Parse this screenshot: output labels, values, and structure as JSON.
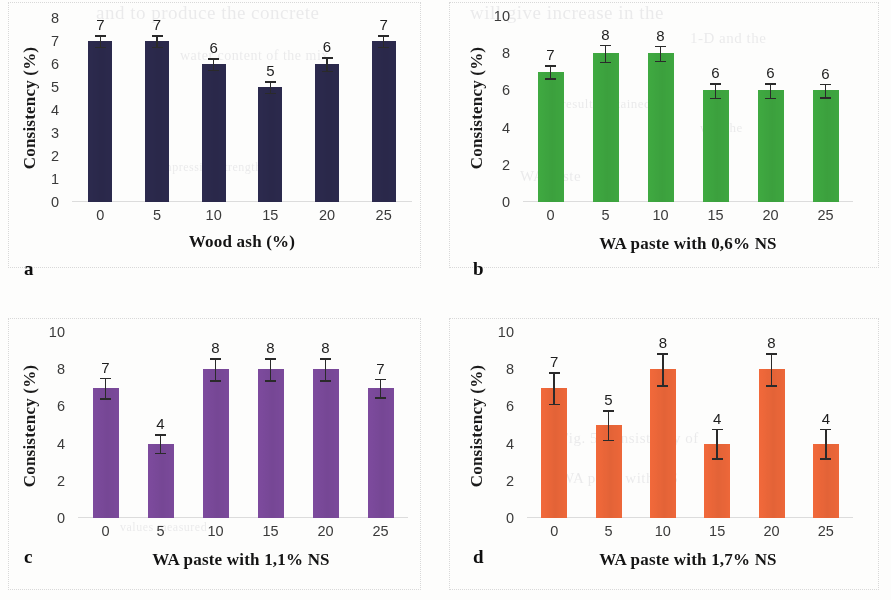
{
  "figure": {
    "background_bleed": [
      {
        "text": "and to  produce  the  concrete",
        "x": 96,
        "y": 2,
        "size": 19
      },
      {
        "text": "will give  increase  in  the",
        "x": 470,
        "y": 2,
        "size": 19
      },
      {
        "text": "1-D  and  the",
        "x": 690,
        "y": 30,
        "size": 15
      },
      {
        "text": "water  content  of  the  mix",
        "x": 180,
        "y": 48,
        "size": 14
      },
      {
        "text": "the  results  obtained",
        "x": 540,
        "y": 96,
        "size": 13
      },
      {
        "text": "was  the",
        "x": 700,
        "y": 120,
        "size": 13
      },
      {
        "text": "WA  paste",
        "x": 520,
        "y": 168,
        "size": 15
      },
      {
        "text": "compressive  strength",
        "x": 150,
        "y": 160,
        "size": 12
      },
      {
        "text": "Fig.  5  Consistency  of",
        "x": 560,
        "y": 430,
        "size": 15
      },
      {
        "text": "WA  paste  with  NS",
        "x": 560,
        "y": 470,
        "size": 15
      },
      {
        "text": "values  measured",
        "x": 120,
        "y": 520,
        "size": 12
      }
    ]
  },
  "chart_data": [
    {
      "id": "a",
      "type": "bar",
      "panel_label": "a",
      "title": "",
      "xlabel": "Wood ash (%)",
      "ylabel": "Consistency (%)",
      "categories": [
        "0",
        "5",
        "10",
        "15",
        "20",
        "25"
      ],
      "values": [
        7,
        7,
        6,
        5,
        6,
        7
      ],
      "errors": [
        0.25,
        0.25,
        0.25,
        0.25,
        0.3,
        0.25
      ],
      "data_labels": [
        "7",
        "7",
        "6",
        "5",
        "6",
        "7"
      ],
      "yticks": [
        "8",
        "7",
        "6",
        "5",
        "4",
        "3",
        "2",
        "1",
        "0"
      ],
      "ylim": [
        0,
        8
      ],
      "ystep": 1,
      "grid": false,
      "bar_color": "#2c2a4e"
    },
    {
      "id": "b",
      "type": "bar",
      "panel_label": "b",
      "title": "",
      "xlabel": "WA paste with 0,6% NS",
      "ylabel": "Consistency (%)",
      "categories": [
        "0",
        "5",
        "10",
        "15",
        "20",
        "25"
      ],
      "values": [
        7,
        8,
        8,
        6,
        6,
        6
      ],
      "errors": [
        0.35,
        0.45,
        0.4,
        0.4,
        0.4,
        0.35
      ],
      "data_labels": [
        "7",
        "8",
        "8",
        "6",
        "6",
        "6"
      ],
      "yticks": [
        "10",
        "8",
        "6",
        "4",
        "2",
        "0"
      ],
      "ylim": [
        0,
        10
      ],
      "ystep": 2,
      "grid": false,
      "bar_color": "#3faa41"
    },
    {
      "id": "c",
      "type": "bar",
      "panel_label": "c",
      "title": "",
      "xlabel": "WA paste with 1,1% NS",
      "ylabel": "Consistency (%)",
      "categories": [
        "0",
        "5",
        "10",
        "15",
        "20",
        "25"
      ],
      "values": [
        7,
        4,
        8,
        8,
        8,
        7
      ],
      "errors": [
        0.55,
        0.5,
        0.6,
        0.6,
        0.6,
        0.5
      ],
      "data_labels": [
        "7",
        "4",
        "8",
        "8",
        "8",
        "7"
      ],
      "yticks": [
        "10",
        "8",
        "6",
        "4",
        "2",
        "0"
      ],
      "ylim": [
        0,
        10
      ],
      "ystep": 2,
      "grid": false,
      "bar_color": "#7d4b9e"
    },
    {
      "id": "d",
      "type": "bar",
      "panel_label": "d",
      "title": "",
      "xlabel": "WA paste with 1,7% NS",
      "ylabel": "Consistency (%)",
      "categories": [
        "0",
        "5",
        "10",
        "15",
        "20",
        "25"
      ],
      "values": [
        7,
        5,
        8,
        4,
        8,
        4
      ],
      "errors": [
        0.85,
        0.8,
        0.85,
        0.8,
        0.85,
        0.8
      ],
      "data_labels": [
        "7",
        "5",
        "8",
        "4",
        "8",
        "4"
      ],
      "yticks": [
        "10",
        "8",
        "6",
        "4",
        "2",
        "0"
      ],
      "ylim": [
        0,
        10
      ],
      "ystep": 2,
      "grid": false,
      "bar_color": "#f2693a"
    }
  ]
}
